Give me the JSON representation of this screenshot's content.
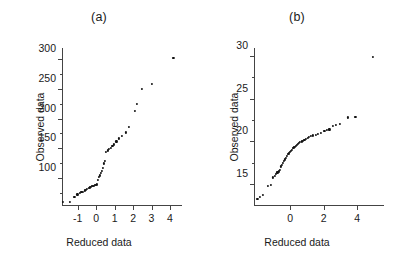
{
  "figure": {
    "background": "#ffffff",
    "point_color": "#111111",
    "axis_color": "#444444"
  },
  "panels": [
    {
      "key": "a",
      "title": "(a)",
      "xlabel": "Reduced data",
      "ylabel": "Observed data"
    },
    {
      "key": "b",
      "title": "(b)",
      "xlabel": "Reduced data",
      "ylabel": "Observed data"
    }
  ],
  "chart_data": [
    {
      "type": "scatter",
      "title": "(a)",
      "xlabel": "Reduced data",
      "ylabel": "Observed data",
      "xticks": [
        -1,
        0,
        1,
        2,
        3,
        4
      ],
      "yticks": [
        100,
        150,
        200,
        250,
        300
      ],
      "xlim": [
        -1.85,
        4.65
      ],
      "ylim": [
        55,
        320
      ],
      "grid": false,
      "legend": null,
      "x": [
        -1.78,
        -1.42,
        -1.18,
        -1.02,
        -0.9,
        -0.8,
        -0.71,
        -0.63,
        -0.55,
        -0.48,
        -0.41,
        -0.35,
        -0.29,
        -0.23,
        -0.17,
        -0.12,
        -0.06,
        -0.01,
        0.04,
        0.09,
        0.14,
        0.19,
        0.25,
        0.3,
        0.36,
        0.42,
        0.48,
        0.55,
        0.62,
        0.7,
        0.78,
        0.88,
        0.98,
        1.1,
        1.24,
        1.4,
        1.6,
        1.78,
        2.1,
        2.22,
        2.5,
        3.02,
        4.18
      ],
      "y": [
        62,
        62,
        70,
        74,
        76,
        78,
        79,
        81,
        82,
        84,
        85,
        86,
        87,
        88,
        88,
        89,
        90,
        90,
        91,
        99,
        103,
        106,
        110,
        114,
        118,
        126,
        130,
        145,
        148,
        150,
        152,
        155,
        158,
        163,
        168,
        172,
        178,
        188,
        214,
        226,
        251,
        259,
        303
      ]
    },
    {
      "type": "scatter",
      "title": "(b)",
      "xlabel": "Reduced data",
      "ylabel": "Observed data",
      "xticks": [
        0,
        2,
        4
      ],
      "yticks": [
        15,
        20,
        25,
        30
      ],
      "xlim": [
        -2.15,
        5.6
      ],
      "ylim": [
        12.6,
        31.0
      ],
      "grid": false,
      "legend": null,
      "x": [
        -1.95,
        -1.8,
        -1.62,
        -1.3,
        -1.16,
        -1.02,
        -0.92,
        -0.83,
        -0.75,
        -0.68,
        -0.6,
        -0.54,
        -0.47,
        -0.41,
        -0.35,
        -0.3,
        -0.24,
        -0.18,
        -0.12,
        -0.07,
        -0.01,
        0.04,
        0.1,
        0.16,
        0.22,
        0.28,
        0.34,
        0.4,
        0.47,
        0.54,
        0.61,
        0.69,
        0.77,
        0.85,
        0.94,
        1.04,
        1.14,
        1.26,
        1.38,
        1.52,
        1.68,
        1.86,
        2.05,
        2.2,
        2.35,
        2.55,
        2.72,
        2.95,
        3.45,
        3.9,
        4.95
      ],
      "y": [
        13.4,
        13.6,
        13.9,
        14.9,
        15.0,
        15.9,
        16.1,
        16.3,
        16.5,
        16.6,
        16.8,
        17.2,
        17.4,
        17.6,
        17.8,
        18.0,
        18.2,
        18.4,
        18.6,
        18.7,
        18.9,
        19.0,
        19.1,
        19.3,
        19.4,
        19.5,
        19.6,
        19.7,
        19.8,
        19.9,
        20.0,
        20.1,
        20.2,
        20.3,
        20.4,
        20.5,
        20.6,
        20.7,
        20.8,
        20.9,
        21.0,
        21.1,
        21.3,
        21.4,
        21.5,
        21.9,
        22.0,
        22.1,
        22.9,
        23.0,
        29.9
      ]
    }
  ]
}
